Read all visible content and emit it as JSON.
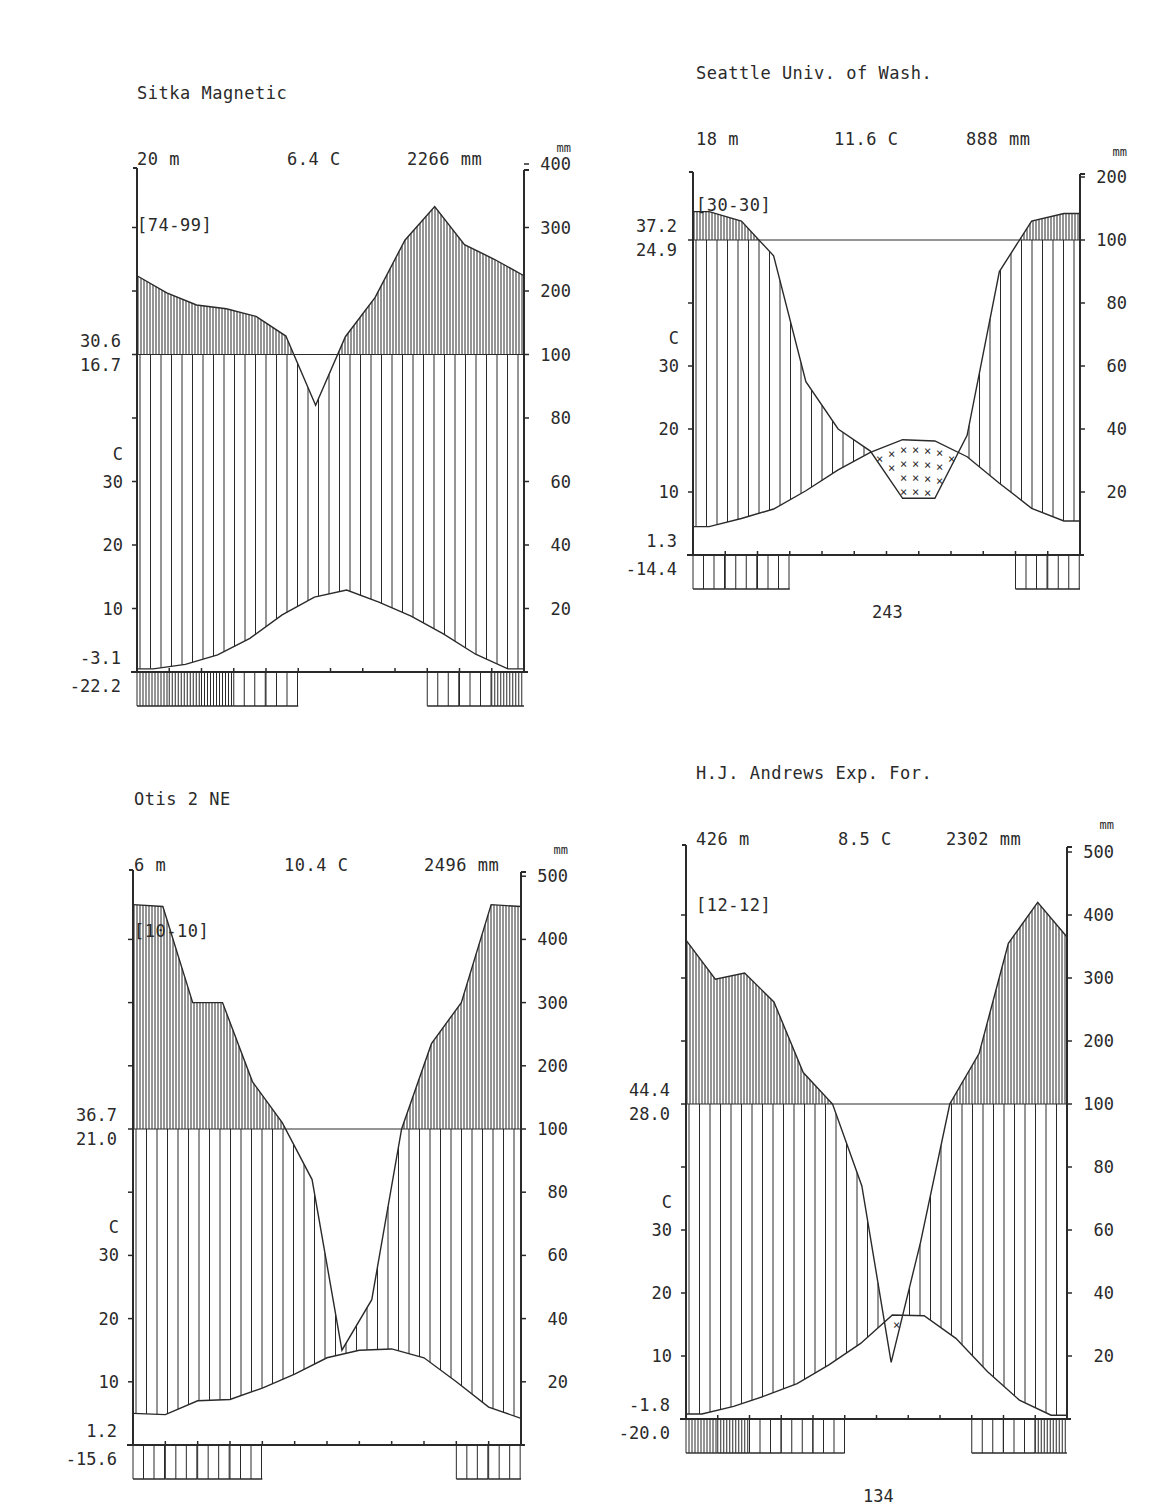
{
  "page_numbers": {
    "seattle": "243",
    "andrews": "134"
  },
  "chart_data": [
    {
      "type": "line",
      "id": "sitka",
      "title": "Sitka Magnetic",
      "elevation": "20 m",
      "mean_temp": "6.4 C",
      "annual_precip": "2266 mm",
      "years": "[74-99]",
      "left_labels": {
        "high_top": "30.6",
        "high_bottom": "16.7",
        "unit": "C",
        "low_top": "-3.1",
        "low_bottom": "-22.2"
      },
      "temp_ticks": [
        "30",
        "20",
        "10"
      ],
      "precip_unit": "mm",
      "precip_ticks": [
        "400",
        "300",
        "200",
        "100",
        "80",
        "60",
        "40",
        "20"
      ],
      "months": [
        "J",
        "F",
        "M",
        "A",
        "M",
        "J",
        "J",
        "A",
        "S",
        "O",
        "N",
        "D"
      ],
      "precip_mm": [
        224,
        197,
        178,
        172,
        160,
        129,
        84,
        128,
        190,
        280,
        333,
        273,
        250,
        224
      ],
      "temp_c": [
        0.5,
        1.2,
        2.7,
        5.3,
        9.0,
        11.8,
        12.9,
        11.0,
        8.8,
        6.0,
        2.8,
        0.5
      ],
      "frost_months": {
        "absolute": [
          1,
          1,
          1,
          1,
          1,
          0,
          0,
          0,
          0,
          1,
          1,
          1
        ],
        "certain": [
          1,
          1,
          1,
          0,
          0,
          0,
          0,
          0,
          0,
          0,
          0,
          1
        ]
      },
      "ylim_temp": [
        0,
        50
      ],
      "ylim_precip": [
        0,
        400
      ]
    },
    {
      "type": "line",
      "id": "seattle",
      "title": "Seattle Univ. of Wash.",
      "elevation": "18 m",
      "mean_temp": "11.6 C",
      "annual_precip": "888 mm",
      "years": "[30-30]",
      "left_labels": {
        "high_top": "37.2",
        "high_bottom": "24.9",
        "unit": "C",
        "low_top": "1.3",
        "low_bottom": "-14.4"
      },
      "temp_ticks": [
        "30",
        "20",
        "10"
      ],
      "precip_unit": "mm",
      "precip_ticks": [
        "200",
        "100",
        "80",
        "60",
        "40",
        "20"
      ],
      "months": [
        "J",
        "F",
        "M",
        "A",
        "M",
        "J",
        "J",
        "A",
        "S",
        "O",
        "N",
        "D"
      ],
      "precip_mm": [
        145,
        130,
        95,
        55,
        40,
        33,
        18,
        18,
        38,
        90,
        130,
        142
      ],
      "temp_c": [
        4.5,
        5.8,
        7.3,
        10.2,
        13.5,
        16.3,
        18.3,
        18.1,
        15.6,
        11.4,
        7.4,
        5.4
      ],
      "frost_months": {
        "absolute": [
          1,
          1,
          1,
          0,
          0,
          0,
          0,
          0,
          0,
          0,
          1,
          1
        ]
      },
      "ylim_temp": [
        0,
        50
      ],
      "ylim_precip": [
        0,
        200
      ]
    },
    {
      "type": "line",
      "id": "otis",
      "title": "Otis 2 NE",
      "elevation": "6 m",
      "mean_temp": "10.4 C",
      "annual_precip": "2496 mm",
      "years": "[10-10]",
      "left_labels": {
        "high_top": "36.7",
        "high_bottom": "21.0",
        "unit": "C",
        "low_top": "1.2",
        "low_bottom": "-15.6"
      },
      "temp_ticks": [
        "30",
        "20",
        "10"
      ],
      "precip_unit": "mm",
      "precip_ticks": [
        "500",
        "400",
        "300",
        "200",
        "100",
        "80",
        "60",
        "40",
        "20"
      ],
      "months": [
        "J",
        "F",
        "M",
        "A",
        "M",
        "J",
        "J",
        "A",
        "S",
        "O",
        "N",
        "D"
      ],
      "precip_mm": [
        455,
        452,
        300,
        300,
        175,
        110,
        84,
        30,
        46,
        100,
        235,
        300,
        455,
        452
      ],
      "temp_c": [
        5.0,
        4.8,
        7.0,
        7.2,
        9.0,
        11.2,
        13.8,
        15.0,
        15.2,
        13.8,
        10.0,
        6.0,
        4.2
      ],
      "frost_months": {
        "absolute": [
          1,
          1,
          1,
          1,
          0,
          0,
          0,
          0,
          0,
          0,
          1,
          1
        ]
      },
      "ylim_temp": [
        0,
        50
      ],
      "ylim_precip": [
        0,
        500
      ]
    },
    {
      "type": "line",
      "id": "andrews",
      "title": "H.J. Andrews Exp. For.",
      "elevation": "426 m",
      "mean_temp": "8.5 C",
      "annual_precip": "2302 mm",
      "years": "[12-12]",
      "left_labels": {
        "high_top": "44.4",
        "high_bottom": "28.0",
        "unit": "C",
        "low_top": "-1.8",
        "low_bottom": "-20.0"
      },
      "temp_ticks": [
        "30",
        "20",
        "10"
      ],
      "precip_unit": "mm",
      "precip_ticks": [
        "500",
        "400",
        "300",
        "200",
        "100",
        "80",
        "60",
        "40",
        "20"
      ],
      "months": [
        "J",
        "F",
        "M",
        "A",
        "M",
        "J",
        "J",
        "A",
        "S",
        "O",
        "N",
        "D"
      ],
      "precip_mm": [
        360,
        298,
        308,
        262,
        150,
        100,
        74,
        18,
        56,
        100,
        180,
        355,
        420,
        365
      ],
      "temp_c": [
        0.8,
        2.0,
        3.7,
        5.6,
        8.6,
        12.0,
        16.5,
        16.4,
        12.8,
        7.5,
        3.0,
        0.6
      ],
      "frost_months": {
        "absolute": [
          1,
          1,
          1,
          1,
          1,
          0,
          0,
          0,
          0,
          1,
          1,
          1
        ],
        "certain": [
          1,
          1,
          0,
          0,
          0,
          0,
          0,
          0,
          0,
          0,
          0,
          1
        ]
      },
      "ylim_temp": [
        0,
        50
      ],
      "ylim_precip": [
        0,
        500
      ]
    }
  ]
}
